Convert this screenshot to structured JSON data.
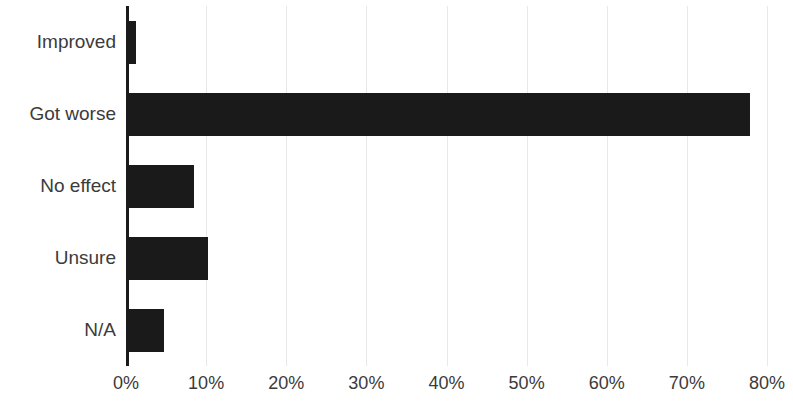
{
  "chart_data": {
    "type": "bar",
    "orientation": "horizontal",
    "title": "",
    "subtitle": "",
    "xlabel": "",
    "ylabel": "",
    "categories": [
      "Improved",
      "Got worse",
      "No effect",
      "Unsure",
      "N/A"
    ],
    "values": [
      1.2,
      77.9,
      8.5,
      10.2,
      4.8
    ],
    "value_suffix": "%",
    "xlim": [
      0,
      80
    ],
    "xtick_values": [
      0,
      10,
      20,
      30,
      40,
      50,
      60,
      70,
      80
    ],
    "xtick_labels": [
      "0%",
      "10%",
      "20%",
      "30%",
      "40%",
      "50%",
      "60%",
      "70%",
      "80%"
    ],
    "grid": true,
    "grid_axis": "x",
    "legend": false,
    "legend_position": "none",
    "bar_color": "#1a1a1a",
    "grid_color": "#e8e8e8",
    "axis_color": "#1a1a1a",
    "text_color": "#3b3b3b",
    "background_color": "#ffffff"
  }
}
